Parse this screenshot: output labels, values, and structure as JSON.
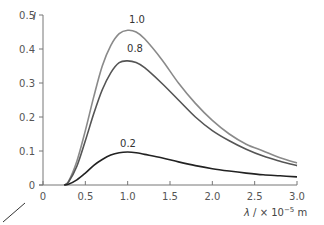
{
  "chart_data": {
    "type": "line",
    "title": "",
    "xlabel": "λ / × 10⁻⁵ m",
    "ylabel": "I",
    "xlim": [
      0,
      3.0
    ],
    "ylim": [
      0,
      0.5
    ],
    "grid": false,
    "legend": "inline labels at curve peaks",
    "x_ticks": [
      "0",
      "0.5",
      "1.0",
      "1.5",
      "2.0",
      "2.5",
      "3.0"
    ],
    "y_ticks": [
      "0",
      "0.1",
      "0.2",
      "0.3",
      "0.4",
      "0.5"
    ],
    "x": [
      0.25,
      0.3,
      0.4,
      0.5,
      0.6,
      0.7,
      0.8,
      0.9,
      1.0,
      1.1,
      1.2,
      1.4,
      1.6,
      1.8,
      2.0,
      2.2,
      2.4,
      2.6,
      2.8,
      3.0
    ],
    "series": [
      {
        "name": "1.0",
        "color": "#8a8a8a",
        "values": [
          0.0,
          0.01,
          0.07,
          0.16,
          0.26,
          0.35,
          0.41,
          0.445,
          0.455,
          0.45,
          0.43,
          0.37,
          0.3,
          0.24,
          0.19,
          0.15,
          0.12,
          0.1,
          0.08,
          0.065
        ]
      },
      {
        "name": "0.8",
        "color": "#555555",
        "values": [
          0.0,
          0.008,
          0.055,
          0.13,
          0.21,
          0.28,
          0.33,
          0.36,
          0.365,
          0.36,
          0.345,
          0.3,
          0.25,
          0.2,
          0.16,
          0.13,
          0.105,
          0.085,
          0.07,
          0.057
        ]
      },
      {
        "name": "0.2",
        "color": "#222222",
        "values": [
          0.0,
          0.002,
          0.015,
          0.035,
          0.058,
          0.075,
          0.088,
          0.095,
          0.097,
          0.095,
          0.09,
          0.08,
          0.068,
          0.057,
          0.048,
          0.041,
          0.035,
          0.03,
          0.027,
          0.024
        ]
      }
    ]
  },
  "labels": {
    "y_axis": "I",
    "x_axis_lambda": "λ",
    "x_axis_rest": " / × 10",
    "x_axis_exp": "−5",
    "x_axis_unit": " m",
    "curve_1": "1.0",
    "curve_2": "0.8",
    "curve_3": "0.2"
  }
}
